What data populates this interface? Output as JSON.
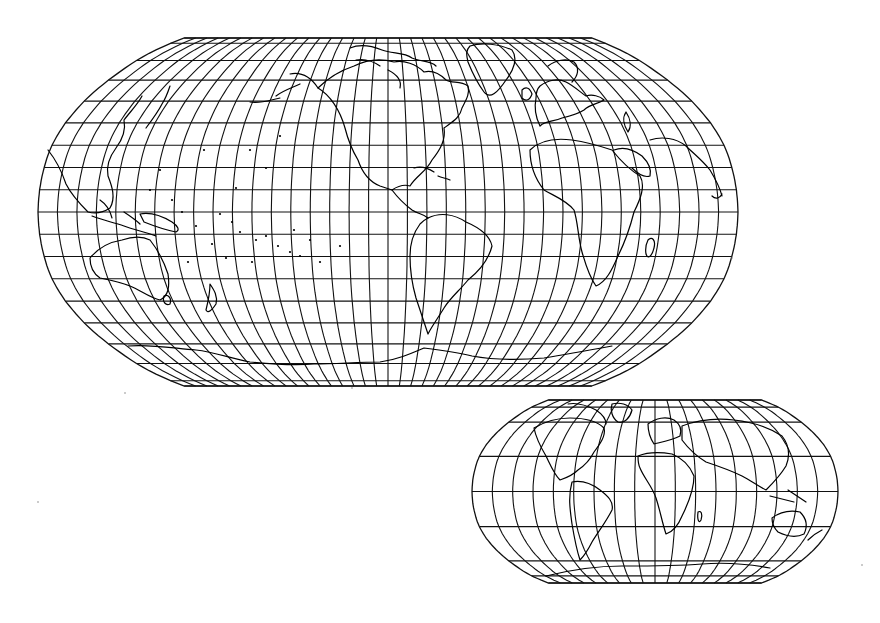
{
  "figure": {
    "background": "#ffffff",
    "line_color": "#111111",
    "coast_color": "#000000"
  },
  "maps": [
    {
      "id": "large-pacific-centered",
      "projection": "Robinson-like pseudocylindrical",
      "center_x": 388,
      "top_y": 38,
      "bottom_y": 386,
      "equator_y": 212,
      "half_width_equator": 350,
      "half_width_top": 213,
      "lat_max": 84,
      "parallels_deg": [
        84,
        80,
        70,
        60,
        50,
        40,
        30,
        20,
        10,
        0,
        -10,
        -20,
        -30,
        -40,
        -50,
        -60,
        -70,
        -80,
        -84
      ],
      "meridian_step_deg": 10,
      "central_meridian_label": "~ -100 (Americas/Pacific centered)"
    },
    {
      "id": "small-atlantic-centered",
      "projection": "Robinson-like pseudocylindrical",
      "center_x": 655,
      "top_y": 400,
      "bottom_y": 583,
      "equator_y": 491,
      "half_width_equator": 183,
      "half_width_top": 110,
      "lat_max": 84,
      "parallels_deg": [
        84,
        75,
        60,
        30,
        0,
        -30,
        -60,
        -75,
        -84
      ],
      "meridian_step_deg": 20,
      "central_meridian_label": "0 (Greenwich centered)"
    }
  ],
  "specks": [
    {
      "x": 125,
      "y": 393
    },
    {
      "x": 38,
      "y": 502
    },
    {
      "x": 352,
      "y": 388
    },
    {
      "x": 732,
      "y": 258
    },
    {
      "x": 862,
      "y": 565
    }
  ]
}
